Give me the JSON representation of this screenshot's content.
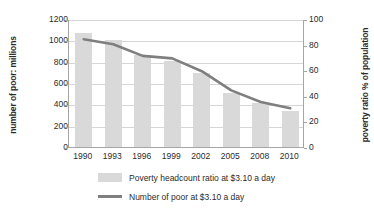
{
  "chart_data": {
    "type": "bar",
    "title": "",
    "xlabel": "",
    "ylabel": "number of poor: millions",
    "y2label": "poverty ratio %  of population",
    "categories": [
      "1990",
      "1993",
      "1996",
      "1999",
      "2002",
      "2005",
      "2008",
      "2010"
    ],
    "ylim": [
      0,
      1200
    ],
    "y2lim": [
      0,
      100
    ],
    "yticks": [
      0,
      200,
      400,
      600,
      800,
      1000,
      1200
    ],
    "y2ticks": [
      0,
      20,
      40,
      60,
      80,
      100
    ],
    "grid": true,
    "legend_position": "bottom",
    "series": [
      {
        "name": "Poverty headcount ratio at $3.10 a day",
        "render": "bar",
        "axis": "left",
        "color": "#d9d9d9",
        "values": [
          1065,
          1000,
          865,
          810,
          690,
          505,
          410,
          335
        ]
      },
      {
        "name": "Number of poor at $3.10 a day",
        "render": "line",
        "axis": "right",
        "color": "#7f7f7f",
        "values": [
          85,
          81,
          72,
          70,
          60,
          45,
          36,
          31
        ]
      }
    ]
  },
  "axes": {
    "left_title": "number of poor: millions",
    "right_title": "poverty ratio %  of population",
    "left_ticks": [
      "1200",
      "1000",
      "800",
      "600",
      "400",
      "200",
      "0"
    ],
    "right_ticks": [
      "100",
      "80",
      "60",
      "40",
      "20",
      "0"
    ],
    "x_ticks": [
      "1990",
      "1993",
      "1996",
      "1999",
      "2002",
      "2005",
      "2008",
      "2010"
    ]
  },
  "legend": {
    "items": [
      {
        "label": "Poverty headcount ratio at $3.10 a day",
        "marker": "bar-swatch",
        "color": "#d9d9d9"
      },
      {
        "label": "Number of poor at $3.10 a day",
        "marker": "line-swatch",
        "color": "#7f7f7f"
      }
    ]
  },
  "colors": {
    "bar": "#d9d9d9",
    "line": "#7f7f7f",
    "grid": "#d6d6d6",
    "axis": "#a6a6a6",
    "text": "#2b2b2b",
    "background": "#ffffff"
  }
}
